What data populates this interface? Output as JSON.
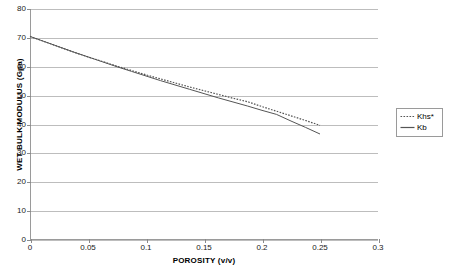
{
  "chart_data": {
    "type": "line",
    "title": "",
    "xlabel": "POROSITY (v/v)",
    "ylabel": "WET BULK MODULUS (Gpa)",
    "xlim": [
      0,
      0.3
    ],
    "ylim": [
      0,
      80
    ],
    "grid": "horizontal",
    "legend_position": "right",
    "x_ticks": [
      "0",
      "0.05",
      "0.1",
      "0.15",
      "0.2",
      "0.25",
      "0.3"
    ],
    "x_tick_values": [
      0,
      0.05,
      0.1,
      0.15,
      0.2,
      0.25,
      0.3
    ],
    "y_ticks": [
      "0",
      "10",
      "20",
      "30",
      "40",
      "50",
      "60",
      "70",
      "80"
    ],
    "y_tick_values": [
      0,
      10,
      20,
      30,
      40,
      50,
      60,
      70,
      80
    ],
    "x": [
      0,
      0.0125,
      0.025,
      0.0375,
      0.05,
      0.0625,
      0.075,
      0.0875,
      0.1,
      0.1125,
      0.125,
      0.1375,
      0.15,
      0.1625,
      0.175,
      0.1875,
      0.2,
      0.2125,
      0.225,
      0.2375,
      0.25
    ],
    "series": [
      {
        "name": "Khs*",
        "style": "dotted",
        "color": "#555555",
        "values": [
          70.5,
          68.7,
          66.9,
          65.1,
          63.4,
          61.8,
          60.2,
          58.7,
          57.2,
          55.8,
          54.4,
          53.0,
          51.7,
          50.4,
          49.1,
          47.9,
          46.2,
          44.6,
          43.0,
          41.4,
          39.7
        ]
      },
      {
        "name": "Kb",
        "style": "solid",
        "color": "#555555",
        "values": [
          70.5,
          68.7,
          66.9,
          65.1,
          63.4,
          61.7,
          60.0,
          58.4,
          56.8,
          55.2,
          53.7,
          52.2,
          50.7,
          49.2,
          47.8,
          46.4,
          44.9,
          43.5,
          41.2,
          39.0,
          36.7
        ]
      }
    ]
  },
  "legend": {
    "entries": [
      {
        "label": "Khs*",
        "swatch": "dotted-line-swatch"
      },
      {
        "label": "Kb",
        "swatch": "solid-line-swatch"
      }
    ]
  },
  "colors": {
    "axis": "#9a9a9a",
    "gridline": "#bdbdbd",
    "series": "#555555",
    "text": "#1a1a1a",
    "background": "#ffffff"
  }
}
